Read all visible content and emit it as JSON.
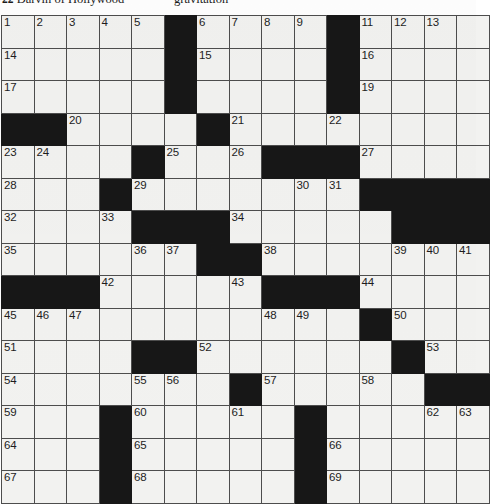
{
  "page": {
    "background_color": "#ffffff",
    "cell_fill_color": "#f2f2f0",
    "block_color": "#171717",
    "grid_line_color": "#4d4d4d",
    "number_color": "#1d1d1d"
  },
  "clues_strip": {
    "left": {
      "number": "22",
      "text": "Darvin of Hollywood"
    },
    "right": {
      "number": "",
      "text": "gravitation"
    }
  },
  "puzzle": {
    "rows": 15,
    "cols": 15,
    "blocks": [
      [
        0,
        5
      ],
      [
        0,
        10
      ],
      [
        1,
        5
      ],
      [
        1,
        10
      ],
      [
        2,
        5
      ],
      [
        2,
        10
      ],
      [
        3,
        0
      ],
      [
        3,
        1
      ],
      [
        3,
        6
      ],
      [
        4,
        4
      ],
      [
        4,
        8
      ],
      [
        4,
        9
      ],
      [
        4,
        10
      ],
      [
        5,
        3
      ],
      [
        5,
        11
      ],
      [
        5,
        12
      ],
      [
        5,
        13
      ],
      [
        5,
        14
      ],
      [
        6,
        4
      ],
      [
        6,
        5
      ],
      [
        6,
        6
      ],
      [
        6,
        12
      ],
      [
        6,
        13
      ],
      [
        6,
        14
      ],
      [
        7,
        6
      ],
      [
        7,
        7
      ],
      [
        8,
        0
      ],
      [
        8,
        1
      ],
      [
        8,
        2
      ],
      [
        8,
        8
      ],
      [
        8,
        9
      ],
      [
        8,
        10
      ],
      [
        9,
        11
      ],
      [
        10,
        4
      ],
      [
        10,
        5
      ],
      [
        10,
        12
      ],
      [
        11,
        7
      ],
      [
        11,
        13
      ],
      [
        11,
        14
      ],
      [
        12,
        3
      ],
      [
        12,
        9
      ],
      [
        13,
        3
      ],
      [
        13,
        9
      ],
      [
        14,
        3
      ],
      [
        14,
        9
      ]
    ],
    "numbers": [
      {
        "r": 0,
        "c": 0,
        "n": "1"
      },
      {
        "r": 0,
        "c": 1,
        "n": "2"
      },
      {
        "r": 0,
        "c": 2,
        "n": "3"
      },
      {
        "r": 0,
        "c": 3,
        "n": "4"
      },
      {
        "r": 0,
        "c": 4,
        "n": "5"
      },
      {
        "r": 0,
        "c": 6,
        "n": "6"
      },
      {
        "r": 0,
        "c": 7,
        "n": "7"
      },
      {
        "r": 0,
        "c": 8,
        "n": "8"
      },
      {
        "r": 0,
        "c": 9,
        "n": "9"
      },
      {
        "r": 0,
        "c": 10,
        "n": "10"
      },
      {
        "r": 0,
        "c": 11,
        "n": "11"
      },
      {
        "r": 0,
        "c": 12,
        "n": "12"
      },
      {
        "r": 0,
        "c": 13,
        "n": "13"
      },
      {
        "r": 1,
        "c": 0,
        "n": "14"
      },
      {
        "r": 1,
        "c": 6,
        "n": "15"
      },
      {
        "r": 1,
        "c": 11,
        "n": "16"
      },
      {
        "r": 2,
        "c": 0,
        "n": "17"
      },
      {
        "r": 2,
        "c": 5,
        "n": "18"
      },
      {
        "r": 2,
        "c": 11,
        "n": "19"
      },
      {
        "r": 3,
        "c": 2,
        "n": "20"
      },
      {
        "r": 3,
        "c": 7,
        "n": "21"
      },
      {
        "r": 3,
        "c": 10,
        "n": "22"
      },
      {
        "r": 4,
        "c": 0,
        "n": "23"
      },
      {
        "r": 4,
        "c": 1,
        "n": "24"
      },
      {
        "r": 4,
        "c": 5,
        "n": "25"
      },
      {
        "r": 4,
        "c": 7,
        "n": "26"
      },
      {
        "r": 4,
        "c": 11,
        "n": "27"
      },
      {
        "r": 5,
        "c": 0,
        "n": "28"
      },
      {
        "r": 5,
        "c": 4,
        "n": "29"
      },
      {
        "r": 5,
        "c": 9,
        "n": "30"
      },
      {
        "r": 5,
        "c": 10,
        "n": "31"
      },
      {
        "r": 6,
        "c": 0,
        "n": "32"
      },
      {
        "r": 6,
        "c": 3,
        "n": "33"
      },
      {
        "r": 6,
        "c": 7,
        "n": "34"
      },
      {
        "r": 7,
        "c": 0,
        "n": "35"
      },
      {
        "r": 7,
        "c": 4,
        "n": "36"
      },
      {
        "r": 7,
        "c": 5,
        "n": "37"
      },
      {
        "r": 7,
        "c": 8,
        "n": "38"
      },
      {
        "r": 7,
        "c": 12,
        "n": "39"
      },
      {
        "r": 7,
        "c": 13,
        "n": "40"
      },
      {
        "r": 7,
        "c": 14,
        "n": "41"
      },
      {
        "r": 8,
        "c": 3,
        "n": "42"
      },
      {
        "r": 8,
        "c": 7,
        "n": "43"
      },
      {
        "r": 8,
        "c": 11,
        "n": "44"
      },
      {
        "r": 9,
        "c": 0,
        "n": "45"
      },
      {
        "r": 9,
        "c": 1,
        "n": "46"
      },
      {
        "r": 9,
        "c": 2,
        "n": "47"
      },
      {
        "r": 9,
        "c": 8,
        "n": "48"
      },
      {
        "r": 9,
        "c": 9,
        "n": "49"
      },
      {
        "r": 9,
        "c": 12,
        "n": "50"
      },
      {
        "r": 10,
        "c": 0,
        "n": "51"
      },
      {
        "r": 10,
        "c": 6,
        "n": "52"
      },
      {
        "r": 10,
        "c": 13,
        "n": "53"
      },
      {
        "r": 11,
        "c": 0,
        "n": "54"
      },
      {
        "r": 11,
        "c": 4,
        "n": "55"
      },
      {
        "r": 11,
        "c": 5,
        "n": "56"
      },
      {
        "r": 11,
        "c": 8,
        "n": "57"
      },
      {
        "r": 11,
        "c": 11,
        "n": "58"
      },
      {
        "r": 12,
        "c": 0,
        "n": "59"
      },
      {
        "r": 12,
        "c": 4,
        "n": "60"
      },
      {
        "r": 12,
        "c": 7,
        "n": "61"
      },
      {
        "r": 12,
        "c": 13,
        "n": "62"
      },
      {
        "r": 12,
        "c": 14,
        "n": "63"
      },
      {
        "r": 13,
        "c": 0,
        "n": "64"
      },
      {
        "r": 13,
        "c": 4,
        "n": "65"
      },
      {
        "r": 13,
        "c": 10,
        "n": "66"
      },
      {
        "r": 14,
        "c": 0,
        "n": "67"
      },
      {
        "r": 14,
        "c": 4,
        "n": "68"
      },
      {
        "r": 14,
        "c": 10,
        "n": "69"
      }
    ]
  }
}
